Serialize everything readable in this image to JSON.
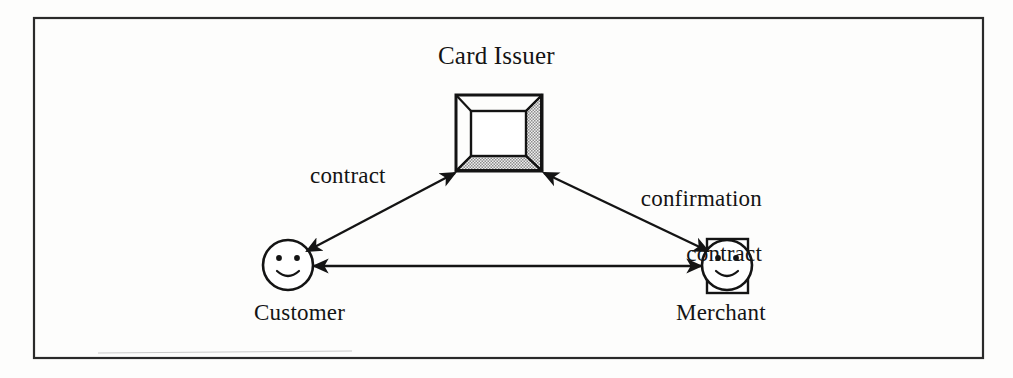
{
  "diagram": {
    "title_text": "Card Issuer",
    "nodes": [
      {
        "id": "card-issuer",
        "label": "Card Issuer",
        "shape": "open-3d-box",
        "label_position": "above"
      },
      {
        "id": "customer",
        "label": "Customer",
        "shape": "smiley-face-circle",
        "label_position": "below"
      },
      {
        "id": "merchant",
        "label": "Merchant",
        "shape": "smiley-face-in-rectangle",
        "label_position": "below"
      }
    ],
    "edges": [
      {
        "id": "customer-card-issuer",
        "from": "customer",
        "to": "card-issuer",
        "arrow": "double",
        "label": "contract"
      },
      {
        "id": "card-issuer-merchant",
        "from": "card-issuer",
        "to": "merchant",
        "arrow": "double",
        "label_line_1": "confirmation",
        "label_line_2": "contract"
      },
      {
        "id": "customer-merchant",
        "from": "customer",
        "to": "merchant",
        "arrow": "double",
        "label": ""
      }
    ],
    "colors": {
      "ink": "#141414",
      "paper": "#fdfdfc",
      "shading": "#b9b9b9",
      "border": "#2a2a2a"
    }
  }
}
